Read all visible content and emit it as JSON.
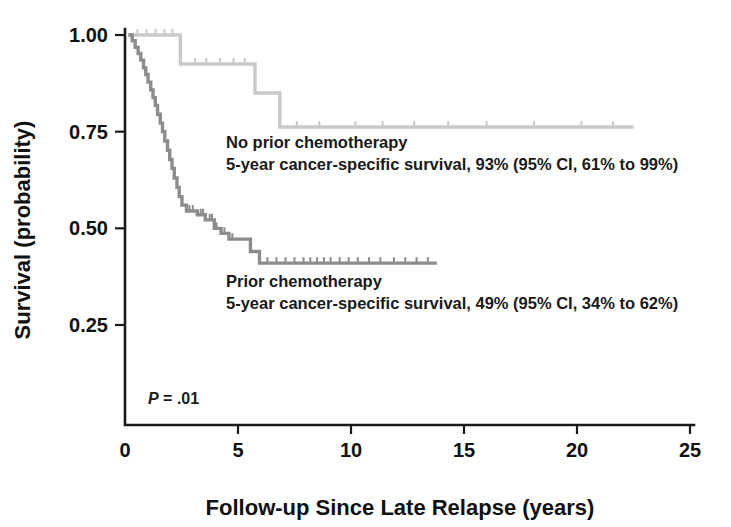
{
  "chart_data": {
    "type": "line",
    "subtype": "kaplan-meier-survival",
    "title": "",
    "xlabel": "Follow-up Since Late Relapse (years)",
    "ylabel": "Survival (probability)",
    "xlim": [
      0,
      25
    ],
    "ylim": [
      0,
      1.0
    ],
    "xticks": [
      0,
      5,
      10,
      15,
      20,
      25
    ],
    "xtick_labels": [
      "0",
      "5",
      "10",
      "15",
      "20",
      "25"
    ],
    "yticks": [
      0.25,
      0.5,
      0.75,
      1.0
    ],
    "ytick_labels": [
      "0.25",
      "0.50",
      "0.75",
      "1.00"
    ],
    "grid": false,
    "legend_position": "inline-annotation",
    "pvalue_label": "P",
    "pvalue_text": " = .01",
    "series": [
      {
        "name": "No prior chemotherapy",
        "color": "#c9c9c9",
        "annotation_line1": "No prior chemotherapy",
        "annotation_line2": "5-year cancer-specific survival, 93% (95% CI, 61% to 99%)",
        "five_year_survival_pct": 93,
        "ci_low_pct": 61,
        "ci_high_pct": 99,
        "steps": [
          [
            0.15,
            1.0
          ],
          [
            2.45,
            1.0
          ],
          [
            2.45,
            0.925
          ],
          [
            5.75,
            0.925
          ],
          [
            5.75,
            0.85
          ],
          [
            6.85,
            0.85
          ],
          [
            6.85,
            0.762
          ],
          [
            22.5,
            0.762
          ]
        ],
        "censor_times": [
          0.55,
          0.95,
          1.35,
          1.75,
          2.1,
          3.1,
          3.6,
          4.2,
          4.8,
          5.3,
          7.6,
          8.6,
          10.2,
          11.4,
          12.8,
          14.3,
          16.0,
          18.1,
          20.2,
          21.6
        ]
      },
      {
        "name": "Prior chemotherapy",
        "color": "#8c8c8c",
        "annotation_line1": "Prior chemotherapy",
        "annotation_line2": "5-year cancer-specific survival, 49% (95% CI, 34% to 62%)",
        "five_year_survival_pct": 49,
        "ci_low_pct": 34,
        "ci_high_pct": 62,
        "steps": [
          [
            0.15,
            1.0
          ],
          [
            0.32,
            1.0
          ],
          [
            0.32,
            0.985
          ],
          [
            0.45,
            0.985
          ],
          [
            0.45,
            0.968
          ],
          [
            0.58,
            0.968
          ],
          [
            0.58,
            0.952
          ],
          [
            0.7,
            0.952
          ],
          [
            0.7,
            0.935
          ],
          [
            0.82,
            0.935
          ],
          [
            0.82,
            0.915
          ],
          [
            0.92,
            0.915
          ],
          [
            0.92,
            0.898
          ],
          [
            1.02,
            0.898
          ],
          [
            1.02,
            0.878
          ],
          [
            1.14,
            0.878
          ],
          [
            1.14,
            0.858
          ],
          [
            1.24,
            0.858
          ],
          [
            1.24,
            0.838
          ],
          [
            1.34,
            0.838
          ],
          [
            1.34,
            0.818
          ],
          [
            1.44,
            0.818
          ],
          [
            1.44,
            0.795
          ],
          [
            1.56,
            0.795
          ],
          [
            1.56,
            0.772
          ],
          [
            1.66,
            0.772
          ],
          [
            1.66,
            0.75
          ],
          [
            1.76,
            0.75
          ],
          [
            1.76,
            0.726
          ],
          [
            1.88,
            0.726
          ],
          [
            1.88,
            0.702
          ],
          [
            1.98,
            0.702
          ],
          [
            1.98,
            0.678
          ],
          [
            2.08,
            0.678
          ],
          [
            2.08,
            0.655
          ],
          [
            2.18,
            0.655
          ],
          [
            2.18,
            0.63
          ],
          [
            2.3,
            0.63
          ],
          [
            2.3,
            0.606
          ],
          [
            2.4,
            0.606
          ],
          [
            2.4,
            0.582
          ],
          [
            2.52,
            0.582
          ],
          [
            2.52,
            0.56
          ],
          [
            2.72,
            0.56
          ],
          [
            2.72,
            0.545
          ],
          [
            3.2,
            0.545
          ],
          [
            3.2,
            0.535
          ],
          [
            3.55,
            0.535
          ],
          [
            3.55,
            0.522
          ],
          [
            3.95,
            0.522
          ],
          [
            3.95,
            0.5
          ],
          [
            4.25,
            0.5
          ],
          [
            4.25,
            0.487
          ],
          [
            4.6,
            0.487
          ],
          [
            4.6,
            0.472
          ],
          [
            5.55,
            0.472
          ],
          [
            5.55,
            0.44
          ],
          [
            5.95,
            0.44
          ],
          [
            5.95,
            0.41
          ],
          [
            13.8,
            0.41
          ]
        ],
        "censor_times": [
          2.85,
          3.0,
          3.35,
          3.45,
          3.75,
          3.85,
          4.05,
          4.4,
          4.75,
          6.3,
          6.7,
          7.1,
          7.5,
          7.9,
          8.2,
          8.5,
          8.8,
          9.1,
          9.5,
          9.9,
          10.3,
          10.8,
          11.3,
          11.9,
          12.4,
          12.9,
          13.4
        ]
      }
    ]
  }
}
